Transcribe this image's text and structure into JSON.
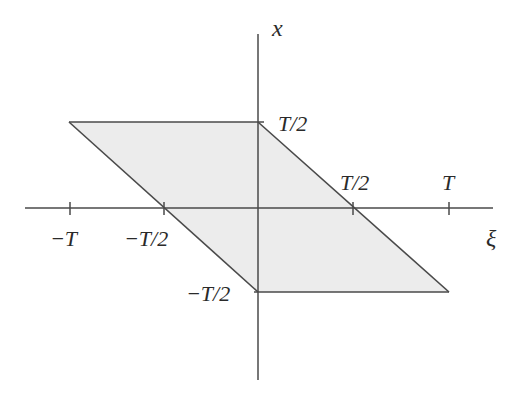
{
  "diagram": {
    "axes": {
      "horizontal": {
        "label": "ξ"
      },
      "vertical": {
        "label": "x"
      }
    },
    "xi_ticks": [
      {
        "label": "−T",
        "value": "-T"
      },
      {
        "label": "−T/2",
        "value": "-T/2"
      },
      {
        "label": "T/2",
        "value": "T/2"
      },
      {
        "label": "T",
        "value": "T"
      }
    ],
    "x_ticks": [
      {
        "label": "T/2",
        "value": "T/2"
      },
      {
        "label": "−T/2",
        "value": "-T/2"
      }
    ],
    "region": {
      "shape": "parallelogram",
      "vertices": [
        {
          "xi": "-T",
          "x": "T/2"
        },
        {
          "xi": "0",
          "x": "T/2"
        },
        {
          "xi": "T",
          "x": "-T/2"
        },
        {
          "xi": "0",
          "x": "-T/2"
        }
      ],
      "fill_color": "#ececec",
      "edge_color": "#4a4a4a"
    },
    "colors": {
      "background": "#ffffff",
      "axis": "#4a4a4a",
      "text": "#2a2a2a"
    }
  }
}
